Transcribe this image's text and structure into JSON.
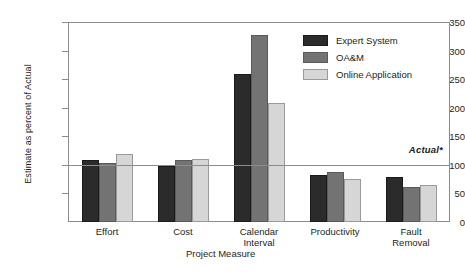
{
  "chart_data": {
    "type": "bar",
    "title": "",
    "xlabel": "Project Measure",
    "ylabel": "Estimate as percent of Actual",
    "categories": [
      "Effort",
      "Cost",
      "Calendar Interval",
      "Productivity",
      "Fault Removal"
    ],
    "category_lines": [
      [
        "Effort"
      ],
      [
        "Cost"
      ],
      [
        "Calendar",
        "Interval"
      ],
      [
        "Productivity"
      ],
      [
        "Fault",
        "Removal"
      ]
    ],
    "series": [
      {
        "name": "Expert System",
        "color": "#2b2b2b",
        "values": [
          109,
          98,
          259,
          82,
          78
        ]
      },
      {
        "name": "OA&M",
        "color": "#737373",
        "values": [
          103,
          108,
          327,
          88,
          62
        ]
      },
      {
        "name": "Online Application",
        "color": "#d6d6d6",
        "values": [
          119,
          110,
          208,
          76,
          65
        ]
      }
    ],
    "ylim": [
      0,
      350
    ],
    "yticks": [
      0,
      50,
      100,
      150,
      200,
      250,
      300,
      350
    ],
    "ytick_labels": [
      "0",
      "50",
      "100",
      "150",
      "200",
      "250",
      "300",
      "350"
    ],
    "grid": false,
    "legend_position": "upper right",
    "annotations": [
      {
        "name": "actual-reference-line",
        "label": "Actual*",
        "value": 100,
        "style": "horizontal-line"
      }
    ]
  },
  "legend": {
    "items": [
      {
        "label": "Expert System"
      },
      {
        "label": "OA&M"
      },
      {
        "label": "Online Application"
      }
    ]
  }
}
